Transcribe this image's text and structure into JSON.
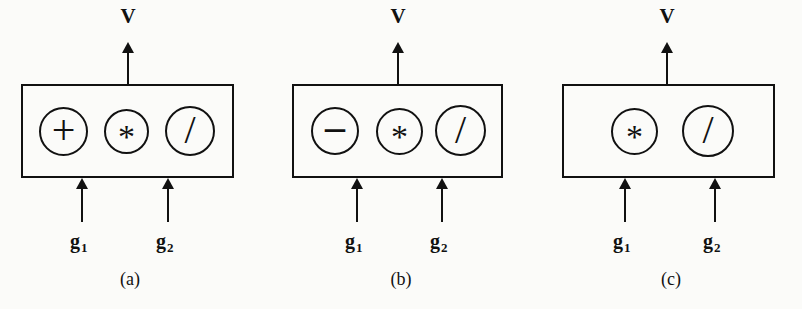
{
  "figure": {
    "type": "diagram",
    "ink_color": "#111111",
    "background_color": "#fbfbf9"
  },
  "panels": [
    {
      "id": "a",
      "caption": "(a)",
      "output_label": "V",
      "operators": [
        "+",
        "*",
        "/"
      ],
      "operator_names": [
        "plus",
        "star",
        "slash"
      ],
      "inputs": [
        {
          "base": "g",
          "sub": "1"
        },
        {
          "base": "g",
          "sub": "2"
        }
      ]
    },
    {
      "id": "b",
      "caption": "(b)",
      "output_label": "V",
      "operators": [
        "–",
        "*",
        "/"
      ],
      "operator_names": [
        "minus",
        "star",
        "slash"
      ],
      "inputs": [
        {
          "base": "g",
          "sub": "1"
        },
        {
          "base": "g",
          "sub": "2"
        }
      ]
    },
    {
      "id": "c",
      "caption": "(c)",
      "output_label": "V",
      "operators": [
        "*",
        "/"
      ],
      "operator_names": [
        "star",
        "slash"
      ],
      "inputs": [
        {
          "base": "g",
          "sub": "1"
        },
        {
          "base": "g",
          "sub": "2"
        }
      ]
    }
  ]
}
